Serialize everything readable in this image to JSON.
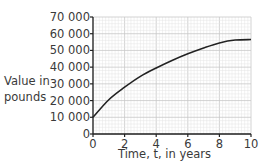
{
  "chart_data": {
    "type": "line",
    "title": "",
    "xlabel": "Time, t, in years",
    "ylabel": "Value in pounds",
    "xlim": [
      0,
      10
    ],
    "ylim": [
      0,
      70000
    ],
    "grid": true,
    "x_ticks": [
      "0",
      "2",
      "4",
      "6",
      "8",
      "10"
    ],
    "y_ticks": [
      "0",
      "10 000",
      "20 000",
      "30 000",
      "40 000",
      "50 000",
      "60 000",
      "70 000"
    ],
    "series": [
      {
        "name": "Value",
        "x": [
          0,
          1,
          2,
          3,
          4,
          5,
          6,
          7,
          8,
          9,
          10
        ],
        "values": [
          10000,
          20500,
          28000,
          34500,
          39500,
          44000,
          48000,
          51500,
          54500,
          56200,
          56500
        ]
      }
    ],
    "colors": {
      "line": "#222222",
      "grid_minor": "#e4e4e4",
      "grid_major": "#c8c8c8",
      "axis": "#222222"
    }
  },
  "labels": {
    "ylabel_line1": "Value in",
    "ylabel_line2": "pounds",
    "xlabel": "Time, t, in years"
  }
}
